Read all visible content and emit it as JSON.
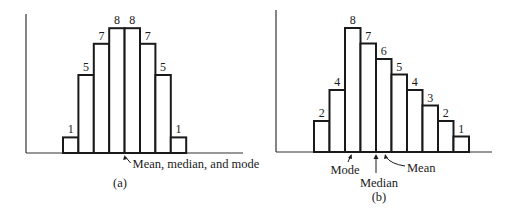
{
  "chart_data": [
    {
      "type": "bar",
      "panel": "(a)",
      "title": "",
      "xlabel": "",
      "ylabel": "",
      "categories": [
        "1",
        "2",
        "3",
        "4",
        "5",
        "6",
        "7",
        "8"
      ],
      "values": [
        1,
        5,
        7,
        8,
        8,
        7,
        5,
        1
      ],
      "bar_labels": [
        "1",
        "5",
        "7",
        "8",
        "8",
        "7",
        "5",
        "1"
      ],
      "ylim": [
        0,
        8
      ],
      "grid": false,
      "shape": "symmetric",
      "annotations": [
        {
          "text": "Mean, median, and mode",
          "position": "center boundary between bars 4 and 5"
        }
      ],
      "caption": "(a)"
    },
    {
      "type": "bar",
      "panel": "(b)",
      "title": "",
      "xlabel": "",
      "ylabel": "",
      "categories": [
        "1",
        "2",
        "3",
        "4",
        "5",
        "6",
        "7",
        "8",
        "9",
        "10"
      ],
      "values": [
        2,
        4,
        8,
        7,
        6,
        5,
        4,
        3,
        2,
        1
      ],
      "bar_labels": [
        "2",
        "4",
        "8",
        "7",
        "6",
        "5",
        "4",
        "3",
        "2",
        "1"
      ],
      "ylim": [
        0,
        8
      ],
      "grid": false,
      "shape": "positively skewed",
      "annotations": [
        {
          "text": "Mode",
          "position": "within bar 3 (tallest bar)"
        },
        {
          "text": "Median",
          "position": "boundary between bars 4 and 5"
        },
        {
          "text": "Mean",
          "position": "within bar 5, right of median"
        }
      ],
      "caption": "(b)"
    }
  ],
  "panels": {
    "a": {
      "caption": "(a)",
      "annotation": "Mean, median, and mode"
    },
    "b": {
      "caption": "(b)",
      "mode_label": "Mode",
      "median_label": "Median",
      "mean_label": "Mean"
    }
  }
}
